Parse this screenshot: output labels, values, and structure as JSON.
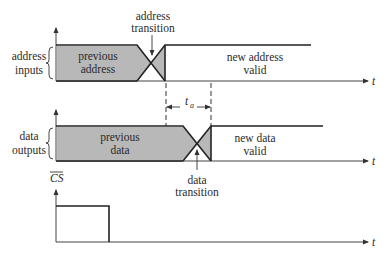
{
  "diagram": {
    "type": "timing-diagram",
    "signals": [
      {
        "name": "address inputs",
        "label_line1": "address",
        "label_line2": "inputs",
        "previous_state_line1": "previous",
        "previous_state_line2": "address",
        "new_state_line1": "new address",
        "new_state_line2": "valid",
        "transition_label_line1": "address",
        "transition_label_line2": "transition",
        "axis_label": "t"
      },
      {
        "name": "data outputs",
        "label_line1": "data",
        "label_line2": "outputs",
        "previous_state_line1": "previous",
        "previous_state_line2": "data",
        "new_state_line1": "new data",
        "new_state_line2": "valid",
        "transition_label_line1": "data",
        "transition_label_line2": "transition",
        "axis_label": "t"
      },
      {
        "name": "chip select (active low)",
        "label": "CS",
        "overline": true,
        "axis_label": "t"
      }
    ],
    "access_time": {
      "symbol": "t",
      "subscript": "a",
      "meaning": "access time between address transition and data transition"
    }
  }
}
